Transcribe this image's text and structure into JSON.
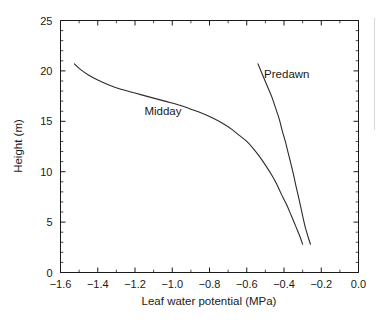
{
  "chart_data": {
    "type": "line",
    "title": "",
    "xlabel": "Leaf water potential (MPa)",
    "ylabel": "Height (m)",
    "xlim": [
      -1.6,
      0.0
    ],
    "ylim": [
      0,
      25
    ],
    "xticks": [
      -1.6,
      -1.4,
      -1.2,
      -1.0,
      -0.8,
      -0.6,
      -0.4,
      -0.2,
      0.0
    ],
    "xticklabels": [
      "−1.6",
      "−1.4",
      "−1.2",
      "−1.0",
      "−0.8",
      "−0.6",
      "−0.4",
      "−0.2",
      "0.0"
    ],
    "yticks": [
      0,
      5,
      10,
      15,
      20,
      25
    ],
    "yticklabels": [
      "0",
      "5",
      "10",
      "15",
      "20",
      "25"
    ],
    "x_minor_step": 0.1,
    "y_minor_step": 1,
    "grid": false,
    "legend_position": "inline-annotation",
    "series": [
      {
        "name": "Midday",
        "label": "Midday",
        "color": "#2b2b2b",
        "annotation_x": -1.05,
        "annotation_y": 15.6,
        "points": [
          [
            -1.525,
            20.7
          ],
          [
            -1.49,
            20.1
          ],
          [
            -1.45,
            19.6
          ],
          [
            -1.4,
            19.1
          ],
          [
            -1.34,
            18.6
          ],
          [
            -1.28,
            18.2
          ],
          [
            -1.2,
            17.8
          ],
          [
            -1.12,
            17.4
          ],
          [
            -1.04,
            17.0
          ],
          [
            -0.96,
            16.6
          ],
          [
            -0.9,
            16.2
          ],
          [
            -0.84,
            15.8
          ],
          [
            -0.78,
            15.3
          ],
          [
            -0.73,
            14.8
          ],
          [
            -0.68,
            14.2
          ],
          [
            -0.64,
            13.6
          ],
          [
            -0.6,
            13.0
          ],
          [
            -0.565,
            12.3
          ],
          [
            -0.535,
            11.6
          ],
          [
            -0.505,
            10.8
          ],
          [
            -0.47,
            9.8
          ],
          [
            -0.44,
            8.8
          ],
          [
            -0.415,
            7.8
          ],
          [
            -0.385,
            6.7
          ],
          [
            -0.36,
            5.6
          ],
          [
            -0.335,
            4.5
          ],
          [
            -0.315,
            3.6
          ],
          [
            -0.3,
            2.8
          ]
        ]
      },
      {
        "name": "Predawn",
        "label": "Predawn",
        "color": "#2b2b2b",
        "annotation_x": -0.385,
        "annotation_y": 19.3,
        "points": [
          [
            -0.54,
            20.7
          ],
          [
            -0.515,
            19.6
          ],
          [
            -0.49,
            18.5
          ],
          [
            -0.465,
            17.4
          ],
          [
            -0.445,
            16.3
          ],
          [
            -0.425,
            15.2
          ],
          [
            -0.41,
            14.1
          ],
          [
            -0.393,
            13.0
          ],
          [
            -0.378,
            11.9
          ],
          [
            -0.363,
            10.8
          ],
          [
            -0.349,
            9.7
          ],
          [
            -0.336,
            8.6
          ],
          [
            -0.322,
            7.5
          ],
          [
            -0.309,
            6.4
          ],
          [
            -0.296,
            5.3
          ],
          [
            -0.283,
            4.3
          ],
          [
            -0.27,
            3.5
          ],
          [
            -0.258,
            2.8
          ]
        ]
      }
    ]
  }
}
